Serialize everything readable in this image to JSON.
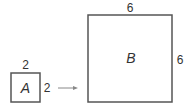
{
  "diagram": {
    "square_a": {
      "label": "A",
      "top_side": "2",
      "right_side": "2"
    },
    "square_b": {
      "label": "B",
      "top_side": "6",
      "right_side": "6"
    },
    "arrow": "right-arrow",
    "colors": {
      "stroke": "#555555",
      "text": "#333333",
      "arrow": "#888888"
    }
  }
}
